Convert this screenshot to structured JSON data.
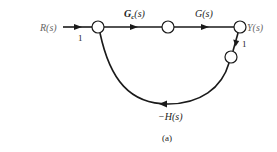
{
  "diagram": {
    "type": "signal-flow-graph",
    "caption": "(a)",
    "nodes": [
      {
        "id": "n1",
        "label": ""
      },
      {
        "id": "n2",
        "label": ""
      },
      {
        "id": "n3",
        "label": "Y(s)"
      },
      {
        "id": "n4",
        "label": ""
      }
    ],
    "input_label": "R(s)",
    "branches": [
      {
        "from": "R",
        "to": "n1",
        "gain": "1"
      },
      {
        "from": "n1",
        "to": "n2",
        "gain_main": "G",
        "gain_sub": "c",
        "gain_arg": "(s)"
      },
      {
        "from": "n2",
        "to": "n3",
        "gain": "G(s)"
      },
      {
        "from": "n3",
        "to": "n4",
        "gain": "1"
      },
      {
        "from": "n4",
        "to": "n1",
        "gain": "−H(s)"
      }
    ],
    "colors": {
      "line": "#1a1a1a",
      "node_fill": "#ffffff"
    }
  }
}
